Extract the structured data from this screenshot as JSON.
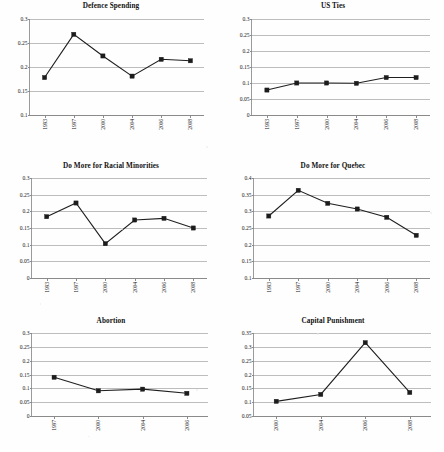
{
  "figure": {
    "panel_count": 6,
    "background_color": "#fefefe",
    "line_color": "#1f1f1f",
    "marker_color": "#1c1c1c",
    "gridline_color": "#bdbdbd",
    "axis_color": "#8a8a8a"
  },
  "chart_data": [
    {
      "type": "line",
      "title": "Defence Spending",
      "xlabel": "",
      "ylabel": "",
      "categories": [
        "1993",
        "1997",
        "2000",
        "2004",
        "2006",
        "2008"
      ],
      "values": [
        0.178,
        0.268,
        0.223,
        0.181,
        0.216,
        0.213
      ],
      "ylim": [
        0.1,
        0.3
      ],
      "yticks": [
        "0.1",
        "0.15",
        "0.2",
        "0.25",
        "0.3"
      ],
      "ytick_values": [
        0.1,
        0.15,
        0.2,
        0.25,
        0.3
      ],
      "grid": true,
      "legend": "none"
    },
    {
      "type": "line",
      "title": "US Ties",
      "xlabel": "",
      "ylabel": "",
      "categories": [
        "1993",
        "1997",
        "2000",
        "2004",
        "2006",
        "2008"
      ],
      "values": [
        0.078,
        0.1,
        0.1,
        0.099,
        0.117,
        0.117
      ],
      "ylim": [
        0,
        0.3
      ],
      "yticks": [
        "0",
        "0.05",
        "0.1",
        "0.15",
        "0.2",
        "0.25",
        "0.3"
      ],
      "ytick_values": [
        0,
        0.05,
        0.1,
        0.15,
        0.2,
        0.25,
        0.3
      ],
      "grid": true,
      "legend": "none"
    },
    {
      "type": "line",
      "title": "Do More for Racial Minorities",
      "xlabel": "",
      "ylabel": "",
      "categories": [
        "1993",
        "1997",
        "2000",
        "2004",
        "2006",
        "2008"
      ],
      "values": [
        0.184,
        0.225,
        0.103,
        0.174,
        0.179,
        0.15
      ],
      "ylim": [
        0,
        0.3
      ],
      "yticks": [
        "0",
        "0.05",
        "0.1",
        "0.15",
        "0.2",
        "0.25",
        "0.3"
      ],
      "ytick_values": [
        0,
        0.05,
        0.1,
        0.15,
        0.2,
        0.25,
        0.3
      ],
      "grid": true,
      "legend": "none"
    },
    {
      "type": "line",
      "title": "Do More for Quebec",
      "xlabel": "",
      "ylabel": "",
      "categories": [
        "1993",
        "1997",
        "2000",
        "2004",
        "2006",
        "2008"
      ],
      "values": [
        0.286,
        0.363,
        0.324,
        0.307,
        0.282,
        0.228
      ],
      "ylim": [
        0.1,
        0.4
      ],
      "yticks": [
        "0.1",
        "0.15",
        "0.2",
        "0.25",
        "0.3",
        "0.35",
        "0.4"
      ],
      "ytick_values": [
        0.1,
        0.15,
        0.2,
        0.25,
        0.3,
        0.35,
        0.4
      ],
      "grid": true,
      "legend": "none"
    },
    {
      "type": "line",
      "title": "Abortion",
      "xlabel": "",
      "ylabel": "",
      "categories": [
        "1997",
        "2000",
        "2004",
        "2006"
      ],
      "values": [
        0.14,
        0.091,
        0.097,
        0.082
      ],
      "ylim": [
        0,
        0.3
      ],
      "yticks": [
        "0",
        "0.05",
        "0.1",
        "0.15",
        "0.2",
        "0.25",
        "0.3"
      ],
      "ytick_values": [
        0,
        0.05,
        0.1,
        0.15,
        0.2,
        0.25,
        0.3
      ],
      "grid": true,
      "legend": "none"
    },
    {
      "type": "line",
      "title": "Capital Punishment",
      "xlabel": "",
      "ylabel": "",
      "categories": [
        "2000",
        "2004",
        "2006",
        "2008"
      ],
      "values": [
        0.103,
        0.128,
        0.315,
        0.135
      ],
      "ylim": [
        0.05,
        0.35
      ],
      "yticks": [
        "0.05",
        "0.1",
        "0.15",
        "0.2",
        "0.25",
        "0.3",
        "0.35"
      ],
      "ytick_values": [
        0.05,
        0.1,
        0.15,
        0.2,
        0.25,
        0.3,
        0.35
      ],
      "grid": true,
      "legend": "none"
    }
  ]
}
